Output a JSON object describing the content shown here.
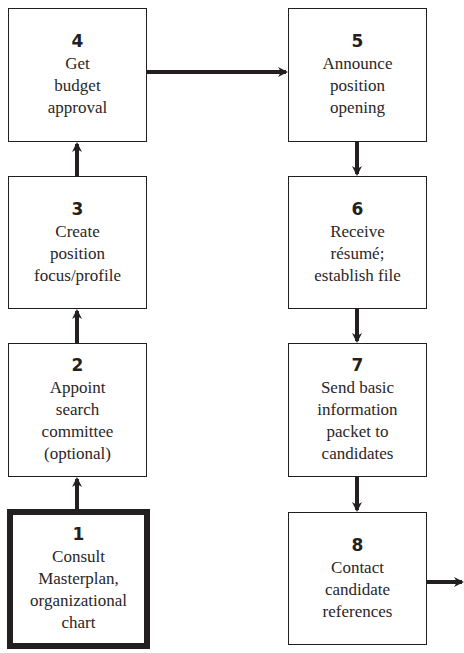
{
  "diagram": {
    "type": "flowchart",
    "boxes": [
      {
        "step": "1",
        "label": "Consult\nMasterplan,\norganizational\nchart",
        "emphasis": "thick-border"
      },
      {
        "step": "2",
        "label": "Appoint\nsearch\ncommittee\n(optional)"
      },
      {
        "step": "3",
        "label": "Create\nposition\nfocus/profile"
      },
      {
        "step": "4",
        "label": "Get\nbudget\napproval"
      },
      {
        "step": "5",
        "label": "Announce\nposition\nopening"
      },
      {
        "step": "6",
        "label": "Receive\nrésumé;\nestablish file"
      },
      {
        "step": "7",
        "label": "Send basic\ninformation\npacket to\ncandidates"
      },
      {
        "step": "8",
        "label": "Contact\ncandidate\nreferences"
      }
    ],
    "connections": [
      {
        "from": "1",
        "to": "2",
        "direction": "up"
      },
      {
        "from": "2",
        "to": "3",
        "direction": "up"
      },
      {
        "from": "3",
        "to": "4",
        "direction": "up"
      },
      {
        "from": "4",
        "to": "5",
        "direction": "right"
      },
      {
        "from": "5",
        "to": "6",
        "direction": "down"
      },
      {
        "from": "6",
        "to": "7",
        "direction": "down"
      },
      {
        "from": "7",
        "to": "8",
        "direction": "down"
      },
      {
        "from": "8",
        "to": "offpage",
        "direction": "right"
      }
    ],
    "colors": {
      "line": "#231f20",
      "background": "#ffffff"
    }
  }
}
